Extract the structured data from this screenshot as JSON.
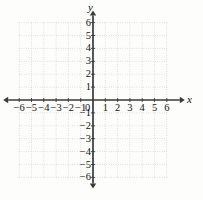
{
  "figure": {
    "kind": "cartesian-coordinate-grid",
    "background_color": "#fdfdfc",
    "axis_color": "#3a3a3a",
    "grid_color": "#c9c9c9",
    "label_color": "#141414"
  },
  "axes": {
    "x_label": "x",
    "y_label": "y",
    "origin_label": "0"
  },
  "chart_data": {
    "type": "scatter",
    "title": "",
    "xlabel": "x",
    "ylabel": "y",
    "xlim": [
      -6,
      6
    ],
    "ylim": [
      -6,
      6
    ],
    "grid": true,
    "grid_style": "dotted",
    "grid_spacing": 1,
    "legend": "none",
    "series": [],
    "x_ticks": [
      -6,
      -5,
      -4,
      -3,
      -2,
      -1,
      1,
      2,
      3,
      4,
      5,
      6
    ],
    "y_ticks": [
      6,
      5,
      4,
      3,
      2,
      1,
      -1,
      -2,
      -3,
      -4,
      -5,
      -6
    ],
    "x_tick_labels": [
      "−6",
      "−5",
      "−4",
      "−3",
      "−2",
      "−1",
      "1",
      "2",
      "3",
      "4",
      "5",
      "6"
    ],
    "y_tick_labels": [
      "6",
      "5",
      "4",
      "3",
      "2",
      "1",
      "−1",
      "−2",
      "−3",
      "−4",
      "−5",
      "−6"
    ]
  },
  "geometry": {
    "origin_x": 93,
    "origin_y": 100,
    "unit_x": 12.3,
    "unit_y": 12.9
  }
}
